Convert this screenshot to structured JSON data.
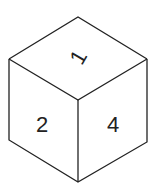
{
  "diagram": {
    "type": "isometric-cube",
    "faces": {
      "top": {
        "label": "1"
      },
      "left": {
        "label": "2"
      },
      "right": {
        "label": "4"
      }
    },
    "colors": {
      "line": "#222222",
      "background": "#ffffff"
    }
  }
}
